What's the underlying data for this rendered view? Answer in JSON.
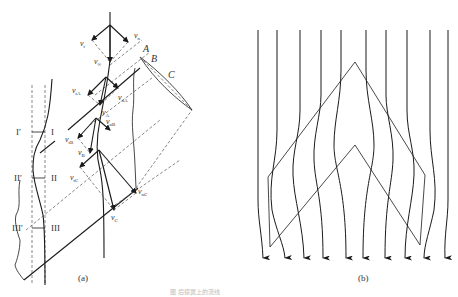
{
  "figure": {
    "panel_a": {
      "caption": "(a)",
      "section_labels": {
        "I_left": "I′",
        "I_right": "I",
        "II_left": "II′",
        "II_right": "II",
        "III_left": "III′",
        "III_right": "III"
      },
      "row_labels": {
        "A": "A",
        "B": "B",
        "C": "C"
      },
      "vectors": {
        "v_t": {
          "main": "v",
          "sub": "t"
        },
        "v_n": {
          "main": "v",
          "sub": "n"
        },
        "v_inf": {
          "main": "v",
          "sub": "∞"
        },
        "v_tA": {
          "main": "v",
          "sub": "tA"
        },
        "v_nA": {
          "main": "v",
          "sub": "nA"
        },
        "v_A": {
          "main": "v",
          "sub": "A"
        },
        "v_nB": {
          "main": "v",
          "sub": "nB"
        },
        "v_tB": {
          "main": "v",
          "sub": "tB"
        },
        "v_B": {
          "main": "v",
          "sub": "B"
        },
        "v_tC": {
          "main": "v",
          "sub": "tC"
        },
        "v_nC": {
          "main": "v",
          "sub": "nC"
        },
        "v_C": {
          "main": "v",
          "sub": "C"
        }
      }
    },
    "panel_b": {
      "caption": "(b)",
      "streamline_count": 10
    },
    "footer_caption": "图 后掠翼上的流线"
  }
}
